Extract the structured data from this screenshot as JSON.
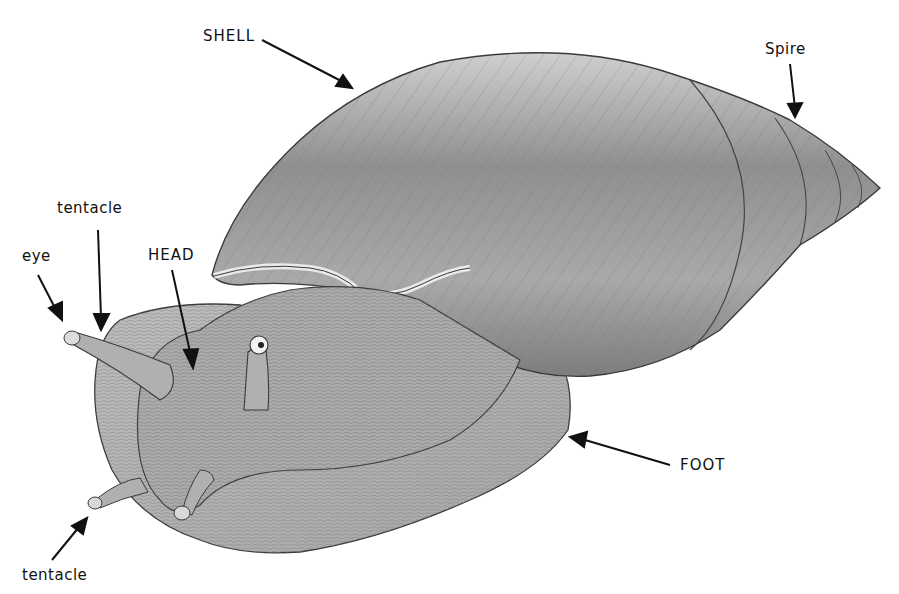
{
  "diagram": {
    "colors": {
      "outline": "#3a3a3a",
      "shell": "#9c9c9c",
      "body": "#b4b4b4",
      "arrow": "#111111"
    },
    "labels": [
      {
        "id": "shell",
        "text": "SHELL",
        "x": 203,
        "y": 27
      },
      {
        "id": "spire",
        "text": "Spire",
        "x": 765,
        "y": 40
      },
      {
        "id": "tentacle-top",
        "text": "tentacle",
        "x": 57,
        "y": 199
      },
      {
        "id": "eye",
        "text": "eye",
        "x": 22,
        "y": 247
      },
      {
        "id": "head",
        "text": "HEAD",
        "x": 148,
        "y": 246
      },
      {
        "id": "foot",
        "text": "FOOT",
        "x": 680,
        "y": 456
      },
      {
        "id": "tentacle-bottom",
        "text": "tentacle",
        "x": 22,
        "y": 566
      }
    ]
  }
}
